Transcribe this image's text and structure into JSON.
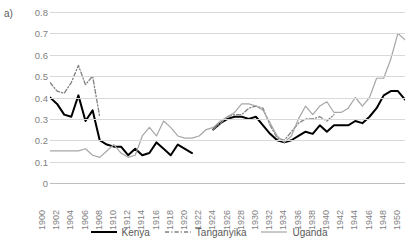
{
  "panel": {
    "label": "a)"
  },
  "chart_data": {
    "type": "line",
    "title": "",
    "xlabel": "",
    "ylabel": "",
    "xlim": [
      1900,
      1950
    ],
    "ylim": [
      0,
      0.8
    ],
    "grid": true,
    "legend_position": "bottom",
    "ytick_labels": [
      "0.8",
      "0.7",
      "0.6",
      "0.5",
      "0.4",
      "0.3",
      "0.2",
      "0.1",
      "0"
    ],
    "ytick_values": [
      0.8,
      0.7,
      0.6,
      0.5,
      0.4,
      0.3,
      0.2,
      0.1,
      0
    ],
    "xtick_labels": [
      "1900",
      "1902",
      "1904",
      "1906",
      "1908",
      "1910",
      "1912",
      "1914",
      "1916",
      "1918",
      "1920",
      "1922",
      "1924",
      "1926",
      "1928",
      "1930",
      "1932",
      "1934",
      "1936",
      "1938",
      "1940",
      "1942",
      "1944",
      "1946",
      "1948",
      "1950"
    ],
    "xtick_values": [
      1900,
      1902,
      1904,
      1906,
      1908,
      1910,
      1912,
      1914,
      1916,
      1918,
      1920,
      1922,
      1924,
      1926,
      1928,
      1930,
      1932,
      1934,
      1936,
      1938,
      1940,
      1942,
      1944,
      1946,
      1948,
      1950
    ],
    "series": [
      {
        "name": "Kenya",
        "color": "#000000",
        "style": "solid",
        "width": 2.0,
        "x": [
          1900,
          1901,
          1902,
          1903,
          1904,
          1905,
          1906,
          1907,
          1908,
          1909,
          1910,
          1911,
          1912,
          1913,
          1914,
          1915,
          1916,
          1917,
          1918,
          1919,
          1920
        ],
        "values": [
          0.4,
          0.37,
          0.32,
          0.31,
          0.41,
          0.29,
          0.34,
          0.2,
          0.18,
          0.17,
          0.17,
          0.13,
          0.16,
          0.13,
          0.14,
          0.19,
          0.16,
          0.13,
          0.18,
          0.16,
          0.14
        ]
      },
      {
        "name": "Kenya",
        "color": "#000000",
        "style": "solid",
        "width": 2.0,
        "x": [
          1923,
          1924,
          1925,
          1926,
          1927,
          1928,
          1929,
          1930,
          1931,
          1932,
          1933,
          1934,
          1935,
          1936,
          1937,
          1938,
          1939,
          1940,
          1941,
          1942,
          1943,
          1944,
          1945,
          1946,
          1947,
          1948,
          1949,
          1950
        ],
        "values": [
          0.25,
          0.28,
          0.3,
          0.31,
          0.31,
          0.3,
          0.31,
          0.27,
          0.23,
          0.2,
          0.19,
          0.2,
          0.22,
          0.24,
          0.23,
          0.27,
          0.24,
          0.27,
          0.27,
          0.27,
          0.29,
          0.28,
          0.31,
          0.35,
          0.41,
          0.43,
          0.43,
          0.39
        ]
      },
      {
        "name": "Tanganyika",
        "color": "#808080",
        "style": "dashdot",
        "width": 1.3,
        "x": [
          1900,
          1901,
          1902,
          1903,
          1904,
          1905,
          1906,
          1907
        ],
        "values": [
          0.47,
          0.43,
          0.42,
          0.47,
          0.55,
          0.46,
          0.5,
          0.31
        ]
      },
      {
        "name": "Tanganyika",
        "color": "#808080",
        "style": "dashdot",
        "width": 1.3,
        "x": [
          1923,
          1924,
          1925,
          1926,
          1927,
          1928,
          1929,
          1930,
          1931,
          1932,
          1933,
          1934,
          1935,
          1936,
          1937,
          1938,
          1939,
          1940
        ],
        "values": [
          0.25,
          0.28,
          0.31,
          0.32,
          0.32,
          0.35,
          0.36,
          0.35,
          0.27,
          0.21,
          0.2,
          0.24,
          0.28,
          0.3,
          0.3,
          0.31,
          0.29,
          0.32
        ]
      },
      {
        "name": "Uganda",
        "color": "#a6a6a6",
        "style": "solid",
        "width": 1.2,
        "x": [
          1900,
          1901,
          1902,
          1903,
          1904,
          1905,
          1906,
          1907,
          1908,
          1909,
          1910,
          1911,
          1912,
          1913,
          1914,
          1915,
          1916,
          1917,
          1918,
          1919,
          1920,
          1921,
          1922,
          1923,
          1924,
          1925,
          1926,
          1927,
          1928,
          1929,
          1930,
          1931,
          1932,
          1933,
          1934,
          1935,
          1936,
          1937,
          1938,
          1939,
          1940,
          1941,
          1942,
          1943,
          1944,
          1945,
          1946,
          1947,
          1948,
          1949,
          1950
        ],
        "values": [
          0.15,
          0.15,
          0.15,
          0.15,
          0.15,
          0.16,
          0.13,
          0.12,
          0.15,
          0.18,
          0.14,
          0.12,
          0.13,
          0.22,
          0.26,
          0.22,
          0.29,
          0.26,
          0.22,
          0.21,
          0.21,
          0.22,
          0.25,
          0.26,
          0.29,
          0.31,
          0.33,
          0.37,
          0.37,
          0.36,
          0.34,
          0.28,
          0.22,
          0.19,
          0.22,
          0.3,
          0.36,
          0.32,
          0.36,
          0.38,
          0.33,
          0.33,
          0.35,
          0.4,
          0.36,
          0.4,
          0.49,
          0.49,
          0.58,
          0.7,
          0.67
        ]
      }
    ],
    "legend": [
      {
        "label": "Kenya",
        "color": "#000000",
        "style": "solid",
        "width": 2.0
      },
      {
        "label": "Tanganyika",
        "color": "#808080",
        "style": "dashdot",
        "width": 1.3
      },
      {
        "label": "Uganda",
        "color": "#a6a6a6",
        "style": "solid",
        "width": 1.2
      }
    ]
  }
}
